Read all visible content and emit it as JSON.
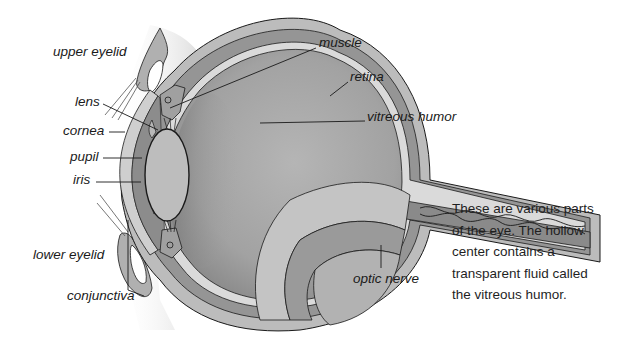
{
  "diagram": {
    "labels": [
      {
        "id": "upper-eyelid",
        "text": "upper eyelid",
        "x": 53,
        "y": 45
      },
      {
        "id": "lens",
        "text": "lens",
        "x": 75,
        "y": 95
      },
      {
        "id": "cornea",
        "text": "cornea",
        "x": 63,
        "y": 124
      },
      {
        "id": "pupil",
        "text": "pupil",
        "x": 70,
        "y": 150
      },
      {
        "id": "iris",
        "text": "iris",
        "x": 73,
        "y": 173
      },
      {
        "id": "lower-eyelid",
        "text": "lower eyelid",
        "x": 33,
        "y": 248
      },
      {
        "id": "conjunctiva",
        "text": "conjunctiva",
        "x": 67,
        "y": 289
      },
      {
        "id": "muscle",
        "text": "muscle",
        "x": 319,
        "y": 36
      },
      {
        "id": "retina",
        "text": "retina",
        "x": 350,
        "y": 70
      },
      {
        "id": "vitreous-humor",
        "text": "vitreous humor",
        "x": 367,
        "y": 110
      },
      {
        "id": "optic-nerve",
        "text": "optic nerve",
        "x": 353,
        "y": 272
      }
    ],
    "colors": {
      "outer_sclera": "#b9b9b9",
      "middle_layer": "#8f8f8f",
      "inner_chamber": "#a7a7a7",
      "lens": "#bdbdbd",
      "outline": "#1a1a1a",
      "background": "#ffffff"
    }
  },
  "caption": {
    "lines": [
      "These are various parts",
      "of the eye. The hollow",
      "center contains a",
      "transparent fluid called",
      "the vitreous humor."
    ]
  }
}
